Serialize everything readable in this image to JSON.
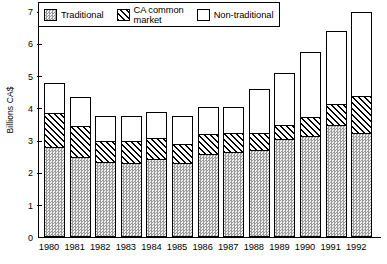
{
  "chart_data": {
    "type": "bar",
    "subtype": "stacked-bar",
    "title": "",
    "xlabel": "",
    "ylabel": "Billions CA$",
    "ylim": [
      0,
      7
    ],
    "yticks": [
      0,
      1,
      2,
      3,
      4,
      5,
      6,
      7
    ],
    "ytick_labels": [
      "0",
      "1",
      "2",
      "3",
      "4",
      "5",
      "6",
      "7"
    ],
    "grid": false,
    "legend_position": "top-center",
    "categories": [
      "1980",
      "1981",
      "1982",
      "1983",
      "1984",
      "1985",
      "1986",
      "1987",
      "1988",
      "1989",
      "1990",
      "1991",
      "1992"
    ],
    "series": [
      {
        "name": "Traditional",
        "pattern": "stipple-checker",
        "values": [
          2.75,
          2.45,
          2.3,
          2.25,
          2.4,
          2.25,
          2.55,
          2.6,
          2.65,
          3.0,
          3.1,
          3.45,
          3.2
        ]
      },
      {
        "name": "CA common\nmarket",
        "pattern": "diagonal-hatch",
        "values": [
          1.05,
          0.95,
          0.65,
          0.7,
          0.65,
          0.6,
          0.6,
          0.6,
          0.55,
          0.45,
          0.6,
          0.65,
          1.15
        ]
      },
      {
        "name": "Non-traditional",
        "pattern": "solid-white",
        "values": [
          0.95,
          0.9,
          0.75,
          0.75,
          0.8,
          0.85,
          0.85,
          0.8,
          1.35,
          1.6,
          2.0,
          2.25,
          2.6
        ]
      }
    ],
    "cumulative_tops": {
      "traditional": [
        2.75,
        2.45,
        2.3,
        2.25,
        2.4,
        2.25,
        2.55,
        2.6,
        2.65,
        3.0,
        3.1,
        3.45,
        3.2
      ],
      "ca_common_market": [
        3.8,
        3.4,
        2.95,
        2.95,
        3.05,
        2.85,
        3.15,
        3.2,
        3.2,
        3.45,
        3.7,
        4.1,
        4.35
      ],
      "totals": [
        4.75,
        4.3,
        3.7,
        3.7,
        3.85,
        3.7,
        4.0,
        4.0,
        4.55,
        5.05,
        5.7,
        6.35,
        6.95
      ]
    }
  },
  "legend": {
    "items": [
      {
        "label": "Traditional",
        "swatch": "stipple-swatch"
      },
      {
        "label": "CA common\nmarket",
        "swatch": "hatch-swatch"
      },
      {
        "label": "Non-traditional",
        "swatch": "white-swatch"
      }
    ]
  }
}
